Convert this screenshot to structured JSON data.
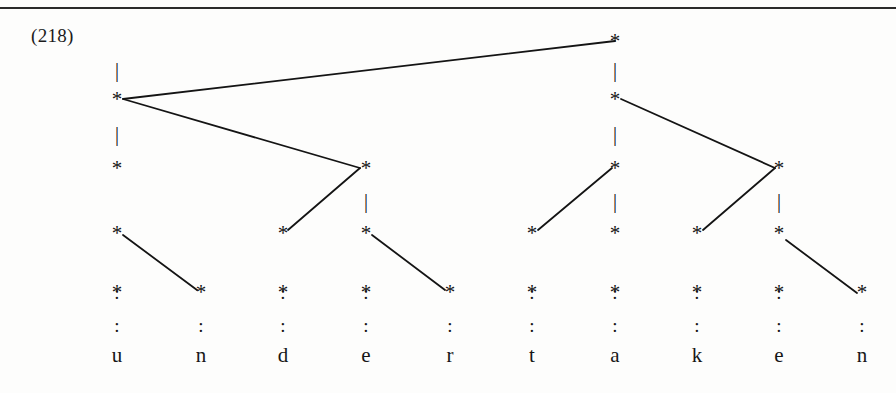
{
  "page": {
    "example_number": "(218)",
    "rule_color": "#2a2a2a",
    "ink_color": "#141414",
    "background": "#fdfdfc"
  },
  "chart_data": {
    "type": "diagram",
    "word": "undertaken",
    "segments": [
      "u",
      "n",
      "d",
      "e",
      "r",
      "t",
      "a",
      "k",
      "e",
      "n"
    ],
    "column_x": [
      117,
      201,
      283,
      366,
      450,
      532,
      615,
      697,
      779,
      862
    ],
    "row_y": [
      41,
      99,
      168,
      233,
      292,
      325,
      355
    ],
    "row_labels": [
      "level-5",
      "level-4",
      "level-3",
      "level-2",
      "level-1",
      "dots",
      "segments"
    ],
    "grid_rows": [
      {
        "level": 5,
        "marks": [
          null,
          null,
          null,
          null,
          null,
          null,
          "*",
          null,
          null,
          null
        ]
      },
      {
        "level": 4,
        "marks": [
          "*",
          null,
          null,
          null,
          null,
          null,
          "*",
          null,
          null,
          null
        ]
      },
      {
        "level": 3,
        "marks": [
          "*",
          null,
          null,
          "*",
          null,
          null,
          "*",
          null,
          "*",
          null
        ]
      },
      {
        "level": 2,
        "marks": [
          "*",
          null,
          "*",
          "*",
          null,
          "*",
          "*",
          "*",
          "*",
          null
        ]
      },
      {
        "level": 1,
        "marks": [
          "*",
          "*",
          "*",
          "*",
          "*",
          "*",
          "*",
          "*",
          "*",
          "*"
        ]
      }
    ],
    "stems": [
      {
        "col": 0,
        "between_levels": "5-4"
      },
      {
        "col": 0,
        "between_levels": "4-3"
      },
      {
        "col": 3,
        "between_levels": "3-2"
      },
      {
        "col": 6,
        "between_levels": "5-4"
      },
      {
        "col": 6,
        "between_levels": "4-3"
      },
      {
        "col": 6,
        "between_levels": "3-2"
      },
      {
        "col": 8,
        "between_levels": "3-2"
      }
    ],
    "dots": [
      {
        "col": 0,
        "rows": [
          5,
          6
        ]
      },
      {
        "col": 1,
        "rows": [
          6
        ]
      },
      {
        "col": 2,
        "rows": [
          5,
          6
        ]
      },
      {
        "col": 3,
        "rows": [
          5,
          6
        ]
      },
      {
        "col": 4,
        "rows": [
          6
        ]
      },
      {
        "col": 5,
        "rows": [
          5,
          6
        ]
      },
      {
        "col": 6,
        "rows": [
          5,
          6
        ]
      },
      {
        "col": 7,
        "rows": [
          5,
          6
        ]
      },
      {
        "col": 8,
        "rows": [
          5,
          6
        ]
      },
      {
        "col": 9,
        "rows": [
          6
        ]
      }
    ],
    "association_lines": [
      {
        "from": [
          615,
          41
        ],
        "to": [
          123,
          99
        ],
        "name": "apex-to-u"
      },
      {
        "from": [
          123,
          99
        ],
        "to": [
          360,
          168
        ],
        "name": "u-to-e-level3"
      },
      {
        "from": [
          621,
          99
        ],
        "to": [
          775,
          168
        ],
        "name": "a-to-e-level3"
      },
      {
        "from": [
          360,
          168
        ],
        "to": [
          288,
          230
        ],
        "name": "e-to-d-level2"
      },
      {
        "from": [
          612,
          168
        ],
        "to": [
          538,
          230
        ],
        "name": "a-to-t-level2"
      },
      {
        "from": [
          775,
          168
        ],
        "to": [
          703,
          230
        ],
        "name": "e-to-k-level2"
      },
      {
        "from": [
          123,
          235
        ],
        "to": [
          197,
          290
        ],
        "name": "u-to-n-level1"
      },
      {
        "from": [
          372,
          235
        ],
        "to": [
          445,
          290
        ],
        "name": "e-to-r-level1"
      },
      {
        "from": [
          786,
          240
        ],
        "to": [
          857,
          293
        ],
        "name": "e-to-n-level1"
      }
    ],
    "glyphs": {
      "mark": "*",
      "dot": ":",
      "stem": "|"
    },
    "xlabel": "",
    "ylabel": "",
    "grid": false,
    "legend": null
  }
}
